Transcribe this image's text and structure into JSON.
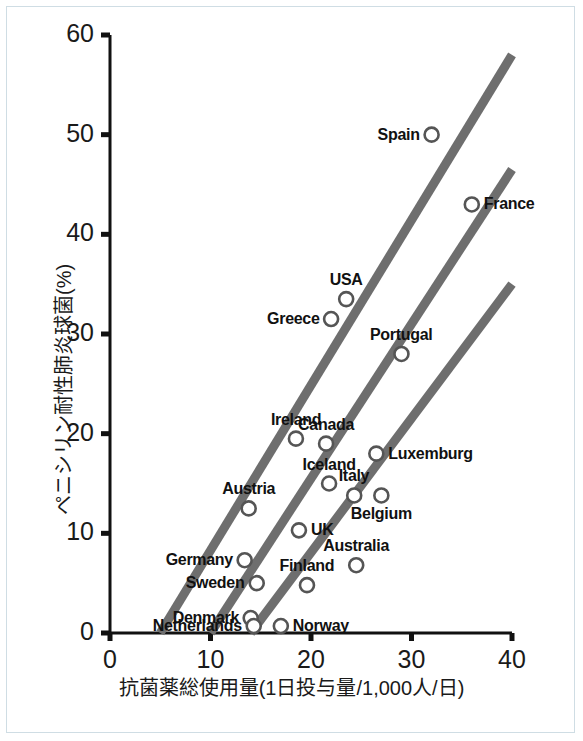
{
  "chart_data": {
    "type": "scatter",
    "title": "",
    "xlabel": "抗菌薬総使用量(1日投与量/1,000人/日)",
    "ylabel": "ペニシリン耐性肺炎球菌(%)",
    "xlim": [
      0,
      40
    ],
    "ylim": [
      0,
      60
    ],
    "xticks": [
      "0",
      "10",
      "20",
      "30",
      "40"
    ],
    "xtick_values": [
      0,
      10,
      20,
      30,
      40
    ],
    "yticks": [
      "0",
      "10",
      "20",
      "30",
      "40",
      "50",
      "60"
    ],
    "ytick_values": [
      0,
      10,
      20,
      30,
      40,
      50,
      60
    ],
    "grid": false,
    "legend": "none",
    "marker": "open-circle",
    "marker_color": "#555555",
    "line_color": "#6e6e6e",
    "points": [
      {
        "label": "Spain",
        "x": 32.0,
        "y": 50.0,
        "label_pos": "left"
      },
      {
        "label": "France",
        "x": 36.0,
        "y": 43.0,
        "label_pos": "right"
      },
      {
        "label": "USA",
        "x": 23.5,
        "y": 33.5,
        "label_pos": "above"
      },
      {
        "label": "Greece",
        "x": 22.0,
        "y": 31.5,
        "label_pos": "left"
      },
      {
        "label": "Portugal",
        "x": 29.0,
        "y": 28.0,
        "label_pos": "above"
      },
      {
        "label": "Ireland",
        "x": 18.5,
        "y": 19.5,
        "label_pos": "above"
      },
      {
        "label": "Canada",
        "x": 21.5,
        "y": 19.0,
        "label_pos": "above"
      },
      {
        "label": "Luxemburg",
        "x": 26.5,
        "y": 18.0,
        "label_pos": "right"
      },
      {
        "label": "Iceland",
        "x": 21.8,
        "y": 15.0,
        "label_pos": "above"
      },
      {
        "label": "Italy",
        "x": 24.3,
        "y": 13.8,
        "label_pos": "above"
      },
      {
        "label": "Belgium",
        "x": 27.0,
        "y": 13.8,
        "label_pos": "below"
      },
      {
        "label": "Austria",
        "x": 13.8,
        "y": 12.5,
        "label_pos": "above"
      },
      {
        "label": "UK",
        "x": 18.8,
        "y": 10.3,
        "label_pos": "right"
      },
      {
        "label": "Germany",
        "x": 13.4,
        "y": 7.3,
        "label_pos": "left"
      },
      {
        "label": "Australia",
        "x": 24.5,
        "y": 6.8,
        "label_pos": "above"
      },
      {
        "label": "Sweden",
        "x": 14.6,
        "y": 5.0,
        "label_pos": "left"
      },
      {
        "label": "Finland",
        "x": 19.6,
        "y": 4.8,
        "label_pos": "above"
      },
      {
        "label": "Denmark",
        "x": 14.0,
        "y": 1.5,
        "label_pos": "left"
      },
      {
        "label": "Netherlands",
        "x": 14.3,
        "y": 0.7,
        "label_pos": "left"
      },
      {
        "label": "Norway",
        "x": 17.0,
        "y": 0.7,
        "label_pos": "right"
      }
    ],
    "trend_lines": [
      {
        "name": "upper-trend",
        "x1": 5.0,
        "y1": 0.0,
        "x2": 40.0,
        "y2": 58.0
      },
      {
        "name": "middle-trend",
        "x1": 10.0,
        "y1": 0.0,
        "x2": 40.0,
        "y2": 46.5
      },
      {
        "name": "lower-trend",
        "x1": 14.0,
        "y1": 0.0,
        "x2": 40.0,
        "y2": 35.0
      }
    ]
  }
}
